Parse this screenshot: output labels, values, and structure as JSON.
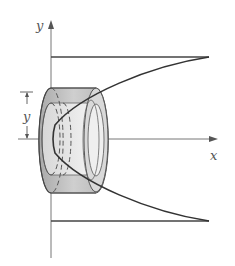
{
  "figure": {
    "axes": {
      "x_label": "x",
      "y_label": "y"
    },
    "dimension_label": "y",
    "colors": {
      "line": "#3a3a3a",
      "axis": "#666666",
      "shell_fill": "#bdbdbd",
      "shell_inner": "#e6e6e6"
    }
  }
}
